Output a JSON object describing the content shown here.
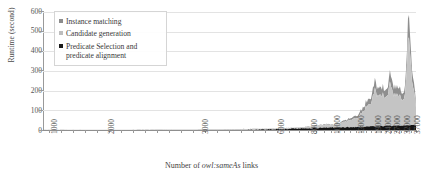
{
  "chart_data": {
    "type": "area",
    "stacked": true,
    "title": "",
    "xlabel_prefix": "Number of ",
    "xlabel_italic": "owl:sameAs",
    "xlabel_suffix": " links",
    "xlabel": "Number of owl:sameAs links",
    "ylabel": "Runtime (second)",
    "ylim": [
      0,
      600
    ],
    "ytick_labels": [
      "0",
      "100",
      "200",
      "300",
      "400",
      "500",
      "600"
    ],
    "ytick_values": [
      0,
      100,
      200,
      300,
      400,
      500,
      600
    ],
    "xtick_labels": [
      "1000",
      "2000",
      "3000",
      "6000",
      "8000",
      "10000",
      "13000",
      "19000",
      "24000",
      "27000",
      "32000",
      "37000"
    ],
    "xtick_positions_pct": [
      1.5,
      17.0,
      42.0,
      62.5,
      71.5,
      77.5,
      84.0,
      88.5,
      91.3,
      93.6,
      96.2,
      99.0
    ],
    "grid": true,
    "legend_position": "top-left",
    "series": [
      {
        "name": "Instance matching",
        "color": "#8c8c8c",
        "values": [
          0,
          0,
          0,
          0,
          0,
          0,
          0,
          0,
          0,
          0,
          0,
          0,
          0,
          0,
          0,
          0,
          0,
          0,
          0,
          0,
          0,
          0,
          0,
          0,
          0,
          0,
          0,
          0,
          0,
          0,
          0,
          0,
          0,
          0,
          0,
          0,
          0,
          0,
          0,
          0,
          0,
          0,
          0,
          0,
          0,
          0,
          0,
          0,
          0,
          0,
          0,
          0,
          0,
          0,
          0,
          0,
          0,
          0,
          0,
          0,
          0,
          0,
          0,
          0,
          0,
          0,
          0,
          0,
          0,
          0,
          0,
          0,
          0,
          0,
          0,
          0,
          0,
          0,
          0,
          0,
          0,
          0,
          0,
          0,
          0,
          0,
          0,
          0,
          0,
          0,
          0,
          0,
          0,
          0,
          0,
          0,
          0,
          0,
          0,
          0,
          0,
          0,
          0,
          0,
          0,
          0,
          0,
          0,
          0,
          0,
          0,
          0,
          0,
          0,
          0,
          0,
          0,
          0,
          0,
          0,
          0,
          0,
          0,
          0,
          0,
          0,
          0,
          0,
          0,
          0,
          0,
          0,
          0,
          0,
          0,
          0,
          0,
          0,
          0,
          0,
          0,
          0,
          0,
          0,
          0,
          0,
          0,
          0,
          0,
          0,
          0,
          0,
          0,
          0,
          0,
          0,
          0,
          0,
          0,
          0,
          0,
          0,
          0,
          0,
          0,
          0,
          0,
          0,
          0,
          0,
          0,
          0,
          0,
          0,
          0,
          0,
          0,
          0,
          0,
          0,
          0,
          0,
          0,
          0,
          0,
          0,
          0,
          0,
          0,
          0,
          0,
          0,
          0,
          0,
          0,
          0,
          0,
          0,
          0,
          0,
          0,
          0,
          0,
          0,
          0,
          0,
          0,
          0,
          0,
          0,
          0,
          0,
          0,
          0,
          0,
          0,
          0,
          0,
          0,
          0,
          0,
          0,
          0,
          0,
          0,
          0,
          0,
          0,
          0,
          0,
          0,
          0,
          0,
          0,
          0,
          0,
          0,
          0,
          0,
          0,
          0,
          0,
          0,
          0,
          0,
          0,
          0,
          0,
          0,
          0,
          0,
          0,
          0,
          0,
          0,
          0,
          0,
          0,
          0,
          0,
          0,
          0,
          0,
          0,
          0,
          0,
          0,
          0,
          0,
          0,
          0,
          0,
          0,
          0,
          0,
          0,
          0,
          0,
          0,
          0,
          0,
          0,
          0,
          0,
          0,
          0,
          0,
          0,
          0,
          0,
          0,
          0,
          0,
          0,
          0,
          0,
          0,
          0,
          0,
          0,
          0,
          0,
          0,
          0,
          0,
          0,
          0,
          0,
          0,
          0,
          0,
          0,
          0,
          0,
          0,
          0,
          0,
          0,
          0,
          0,
          0,
          0,
          0,
          0,
          0,
          0,
          0,
          0,
          0,
          0,
          0,
          0,
          0,
          0,
          0,
          0,
          0,
          0,
          0,
          0,
          0,
          0,
          0,
          0,
          0,
          0,
          0,
          0,
          0,
          0,
          0,
          0,
          0,
          0,
          0,
          0,
          0,
          0,
          0,
          0,
          0,
          0,
          0,
          0,
          0,
          0,
          0,
          0,
          0,
          0,
          0,
          0,
          0,
          0,
          0,
          0,
          0,
          0,
          0,
          0,
          0,
          0,
          0,
          0,
          0,
          0,
          0,
          0,
          0,
          0,
          0,
          0,
          0,
          0,
          0,
          0,
          0,
          0,
          0,
          0,
          0,
          0,
          0,
          0
        ],
        "note": "upper band; values rendered via stacked path geometry"
      },
      {
        "name": "Candidate generation",
        "color": "#bdbdbd",
        "note": "middle band; dominant contributor to the ramp after 13000"
      },
      {
        "name": "Predicate Selection and predicate alignment",
        "color": "#1a1a1a",
        "note": "thin bottom band, reaching ~15-25 s at the right end"
      }
    ],
    "stacked_total_profile": [
      {
        "x_pct": 0,
        "total": 0.5
      },
      {
        "x_pct": 5,
        "total": 0.8
      },
      {
        "x_pct": 10,
        "total": 1.0
      },
      {
        "x_pct": 15,
        "total": 1.2
      },
      {
        "x_pct": 20,
        "total": 1.5
      },
      {
        "x_pct": 25,
        "total": 1.8
      },
      {
        "x_pct": 30,
        "total": 2.2
      },
      {
        "x_pct": 35,
        "total": 2.6
      },
      {
        "x_pct": 40,
        "total": 3.0
      },
      {
        "x_pct": 45,
        "total": 3.6
      },
      {
        "x_pct": 50,
        "total": 4.4
      },
      {
        "x_pct": 55,
        "total": 5.5
      },
      {
        "x_pct": 60,
        "total": 7.0
      },
      {
        "x_pct": 63,
        "total": 9.0
      },
      {
        "x_pct": 66,
        "total": 11.0
      },
      {
        "x_pct": 69,
        "total": 14.0
      },
      {
        "x_pct": 72,
        "total": 18.0
      },
      {
        "x_pct": 74,
        "total": 24.0
      },
      {
        "x_pct": 76,
        "total": 30.0
      },
      {
        "x_pct": 78,
        "total": 26.0
      },
      {
        "x_pct": 80,
        "total": 40.0
      },
      {
        "x_pct": 82,
        "total": 55.0
      },
      {
        "x_pct": 84,
        "total": 70.0
      },
      {
        "x_pct": 85,
        "total": 95.0
      },
      {
        "x_pct": 86,
        "total": 120.0
      },
      {
        "x_pct": 87,
        "total": 150.0
      },
      {
        "x_pct": 88,
        "total": 175.0
      },
      {
        "x_pct": 89,
        "total": 240.0
      },
      {
        "x_pct": 90,
        "total": 200.0
      },
      {
        "x_pct": 91,
        "total": 215.0
      },
      {
        "x_pct": 92,
        "total": 185.0
      },
      {
        "x_pct": 93,
        "total": 300.0
      },
      {
        "x_pct": 94,
        "total": 215.0
      },
      {
        "x_pct": 95,
        "total": 230.0
      },
      {
        "x_pct": 96,
        "total": 190.0
      },
      {
        "x_pct": 97,
        "total": 210.0
      },
      {
        "x_pct": 98,
        "total": 580.0
      },
      {
        "x_pct": 99,
        "total": 300.0
      },
      {
        "x_pct": 100,
        "total": 150.0
      }
    ],
    "peak": {
      "value": 580,
      "x_label": "37000"
    }
  },
  "legend": {
    "items": [
      {
        "label": "Instance matching",
        "color": "#8c8c8c"
      },
      {
        "label": "Candidate generation",
        "color": "#bdbdbd"
      },
      {
        "label": "Predicate Selection and predicate alignment",
        "color": "#1a1a1a"
      }
    ]
  }
}
